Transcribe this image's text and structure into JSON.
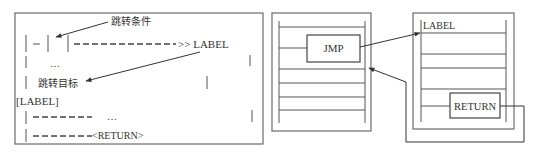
{
  "left_panel": {
    "jump_condition_label": "跳转条件",
    "jump_target_label": "跳转目标",
    "row1_dash": "—",
    "row1_arrow_text": ">> LABEL",
    "row2_ellipsis": "…",
    "label_bracket": "[LABEL]",
    "row5_ellipsis": "…",
    "row6_return": "<RETURN>"
  },
  "middle_panel": {
    "jmp_label": "JMP"
  },
  "right_panel": {
    "label_text": "LABEL",
    "return_label": "RETURN"
  },
  "colors": {
    "stroke": "#555555",
    "text": "#333333",
    "background": "#ffffff"
  }
}
